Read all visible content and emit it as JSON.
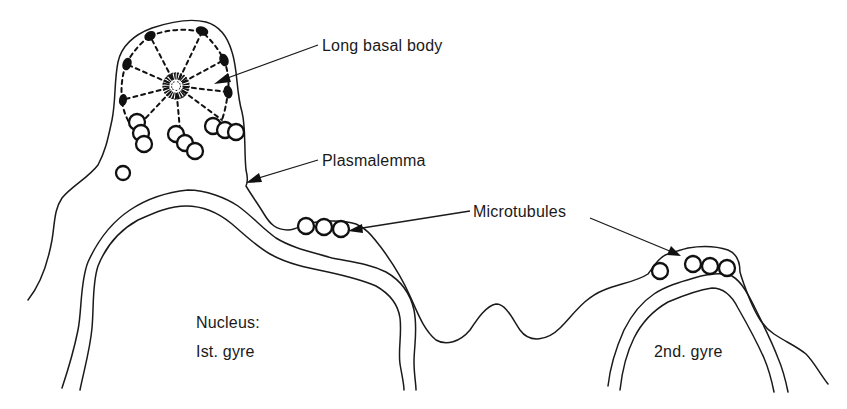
{
  "figure": {
    "type": "biological cross-section schematic",
    "background": "#ffffff",
    "ink_color": "#111111"
  },
  "labels": {
    "long_basal_body": "Long basal body",
    "plasmalemma": "Plasmalemma",
    "microtubules": "Microtubules",
    "nucleus_line1": "Nucleus:",
    "nucleus_line2": "Ist. gyre",
    "second_gyre": "2nd. gyre"
  },
  "structures": {
    "basal_body": {
      "peripheral_dense_bodies": 9,
      "radial_spokes": 9
    },
    "microtubule_groups": [
      {
        "location": "apical process, left column",
        "count": 3
      },
      {
        "location": "apical process, middle column",
        "count": 3
      },
      {
        "location": "apical process, right column",
        "count": 3
      },
      {
        "location": "apical process, isolated",
        "count": 1
      },
      {
        "location": "over 1st gyre shoulder",
        "count": 3
      },
      {
        "location": "over 2nd gyre",
        "count": 4
      }
    ]
  }
}
